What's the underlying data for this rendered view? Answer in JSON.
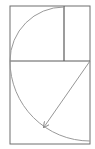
{
  "diagram": {
    "title": "",
    "type": "golden-rectangle-construction",
    "colors": {
      "background": "#ffffff",
      "frame": "#6e6e6e",
      "divider": "#5a5a5a",
      "arc": "#9a9a9a",
      "arrow": "#8a8a8a"
    },
    "outer_rect": {
      "x": 10,
      "y": 6,
      "w": 80,
      "h": 138
    },
    "vertical_divider": {
      "x": 64,
      "y1": 6,
      "y2": 61
    },
    "horizontal_divider": {
      "y": 61,
      "x1": 10,
      "x2": 90
    },
    "upper_arc": {
      "cx": 64,
      "cy": 61,
      "r": 54
    },
    "lower_arc": {
      "cx": 90,
      "cy": 61,
      "r": 80
    },
    "arrow": {
      "x1": 90,
      "y1": 61,
      "x2": 44,
      "y2": 127
    }
  }
}
